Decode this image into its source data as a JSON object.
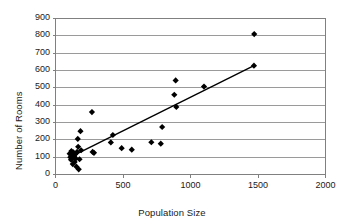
{
  "chart_data": {
    "type": "scatter",
    "title": "",
    "xlabel": "Population Size",
    "ylabel": "Number of Rooms",
    "xlim": [
      0,
      2000
    ],
    "ylim": [
      0,
      900
    ],
    "xticks": [
      0,
      500,
      1000,
      1500,
      2000
    ],
    "yticks": [
      0,
      100,
      200,
      300,
      400,
      500,
      600,
      700,
      800,
      900
    ],
    "grid": "horizontal",
    "legend": "none",
    "marker": "filled-diamond",
    "marker_color": "#000000",
    "line_color": "#000000",
    "grid_color": "#9a9a9a",
    "axis_color": "#808080",
    "points": [
      {
        "x": 105,
        "y": 120
      },
      {
        "x": 110,
        "y": 100
      },
      {
        "x": 115,
        "y": 85
      },
      {
        "x": 118,
        "y": 135
      },
      {
        "x": 120,
        "y": 110
      },
      {
        "x": 125,
        "y": 95
      },
      {
        "x": 128,
        "y": 60
      },
      {
        "x": 132,
        "y": 128
      },
      {
        "x": 138,
        "y": 105
      },
      {
        "x": 142,
        "y": 72
      },
      {
        "x": 148,
        "y": 118
      },
      {
        "x": 150,
        "y": 92
      },
      {
        "x": 155,
        "y": 45
      },
      {
        "x": 160,
        "y": 130
      },
      {
        "x": 165,
        "y": 205
      },
      {
        "x": 168,
        "y": 160
      },
      {
        "x": 172,
        "y": 30
      },
      {
        "x": 178,
        "y": 88
      },
      {
        "x": 185,
        "y": 250
      },
      {
        "x": 190,
        "y": 140
      },
      {
        "x": 270,
        "y": 360
      },
      {
        "x": 275,
        "y": 130
      },
      {
        "x": 285,
        "y": 125
      },
      {
        "x": 410,
        "y": 185
      },
      {
        "x": 425,
        "y": 228
      },
      {
        "x": 490,
        "y": 152
      },
      {
        "x": 565,
        "y": 143
      },
      {
        "x": 710,
        "y": 186
      },
      {
        "x": 780,
        "y": 178
      },
      {
        "x": 790,
        "y": 274
      },
      {
        "x": 880,
        "y": 460
      },
      {
        "x": 890,
        "y": 543
      },
      {
        "x": 895,
        "y": 390
      },
      {
        "x": 1100,
        "y": 507
      },
      {
        "x": 1470,
        "y": 628
      },
      {
        "x": 1472,
        "y": 810
      }
    ],
    "trendline": {
      "x1": 120,
      "y1": 105,
      "x2": 1470,
      "y2": 628
    }
  }
}
